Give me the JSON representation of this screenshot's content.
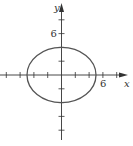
{
  "chart_data": {
    "type": "line",
    "title": "",
    "xlabel": "x",
    "ylabel": "y",
    "x_tick_labels": [
      {
        "value": 6,
        "label": "6"
      }
    ],
    "y_tick_labels": [
      {
        "value": 6,
        "label": "6"
      }
    ],
    "tick_step": 2,
    "xlim": [
      -9,
      10
    ],
    "ylim": [
      -9,
      10.5
    ],
    "grid": false,
    "legend": null,
    "series": [
      {
        "name": "ellipse",
        "shape": "ellipse",
        "equation": "x^2/25 + y^2/16 = 1",
        "center": [
          0,
          0
        ],
        "semi_axis_x": 5,
        "semi_axis_y": 4,
        "color": "#555555"
      }
    ]
  },
  "colors": {
    "axis": "#333333",
    "curve": "#555555",
    "background": "#ffffff"
  }
}
